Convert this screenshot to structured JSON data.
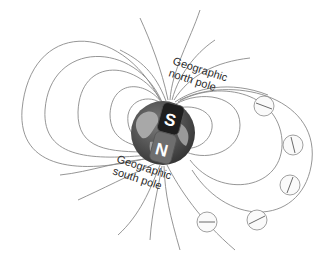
{
  "diagram": {
    "labels": {
      "north_line1": "Geographic",
      "north_line2": "north pole",
      "south_line1": "Geographic",
      "south_line2": "south pole",
      "magnet_top": "S",
      "magnet_bottom": "N"
    },
    "compass_count": 7,
    "colors": {
      "field_line": "#8a8a8a",
      "earth_dark": "#4a4a4a",
      "earth_land": "#9a9a9a",
      "magnet_s": "#1e1e1e",
      "magnet_n": "#6e6e6e"
    }
  }
}
